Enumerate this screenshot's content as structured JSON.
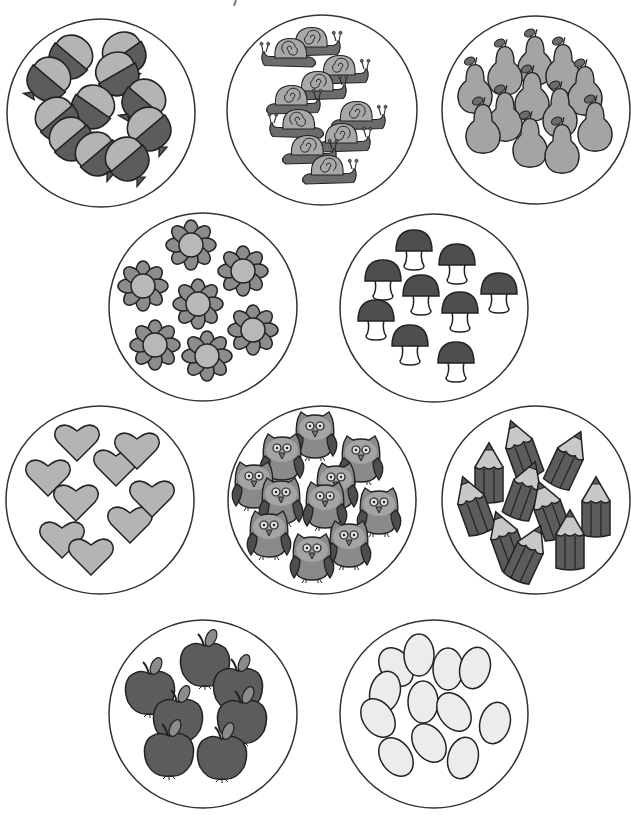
{
  "page": {
    "background": "#ffffff",
    "stroke": "#222222"
  },
  "colors": {
    "light_gray": "#b4b4b4",
    "mid_gray": "#8c8c8c",
    "dark_gray": "#5c5c5c",
    "very_light": "#ececec",
    "circle_stroke": "#333333"
  },
  "groups": [
    {
      "id": "acorns",
      "object": "acorn",
      "count": 12,
      "cx": 101,
      "cy": 113,
      "r": 94
    },
    {
      "id": "snails",
      "object": "snail",
      "count": 11,
      "cx": 322,
      "cy": 110,
      "r": 95
    },
    {
      "id": "pears",
      "object": "pear",
      "count": 13,
      "cx": 536,
      "cy": 110,
      "r": 94
    },
    {
      "id": "flowers",
      "object": "flower",
      "count": 7,
      "cx": 203,
      "cy": 307,
      "r": 94
    },
    {
      "id": "mushrooms",
      "object": "mushroom",
      "count": 9,
      "cx": 434,
      "cy": 308,
      "r": 94
    },
    {
      "id": "hearts",
      "object": "heart",
      "count": 10,
      "cx": 100,
      "cy": 500,
      "r": 94
    },
    {
      "id": "owls",
      "object": "owl",
      "count": 11,
      "cx": 322,
      "cy": 500,
      "r": 94
    },
    {
      "id": "pencils",
      "object": "pencil",
      "count": 11,
      "cx": 536,
      "cy": 500,
      "r": 94
    },
    {
      "id": "apples",
      "object": "apple",
      "count": 7,
      "cx": 203,
      "cy": 714,
      "r": 94
    },
    {
      "id": "eggs",
      "object": "egg",
      "count": 13,
      "cx": 434,
      "cy": 714,
      "r": 94
    }
  ]
}
